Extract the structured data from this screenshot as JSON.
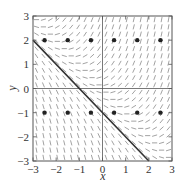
{
  "chart_data": {
    "type": "slope_field",
    "title": "",
    "equation_implied": "dy/dx = x + y",
    "xlabel": "x",
    "ylabel": "y",
    "xlim": [
      -3,
      3
    ],
    "ylim": [
      -3,
      3
    ],
    "xticks": [
      -3,
      -2,
      -1,
      0,
      1,
      2,
      3
    ],
    "yticks": [
      -3,
      -2,
      -1,
      0,
      1,
      2,
      3
    ],
    "xtick_labels": [
      "−3",
      "−2",
      "−1",
      "0",
      "1",
      "2",
      "3"
    ],
    "ytick_labels": [
      "−3",
      "−2",
      "−1",
      "0",
      "1",
      "2",
      "3"
    ],
    "grid": false,
    "axes_lines_through_origin": true,
    "field_grid": {
      "start": -2.85,
      "step": 0.3,
      "count": 20
    },
    "solution_line": {
      "label": "y = -x - 1",
      "points": [
        [
          -3,
          2
        ],
        [
          2,
          -3
        ]
      ]
    },
    "marked_points": [
      [
        -2.5,
        2
      ],
      [
        -1.5,
        2
      ],
      [
        -0.5,
        2
      ],
      [
        0.5,
        2
      ],
      [
        1.5,
        2
      ],
      [
        2.5,
        2
      ],
      [
        -2.5,
        -1
      ],
      [
        -1.5,
        -1
      ],
      [
        -0.5,
        -1
      ],
      [
        0.5,
        -1
      ],
      [
        1.5,
        -1
      ],
      [
        2.5,
        -1
      ]
    ],
    "colors": {
      "field": "#8a8a8a",
      "frame": "#555555",
      "line": "#333333",
      "points": "#222222"
    }
  },
  "layout": {
    "plot_left": 33,
    "plot_top": 16,
    "plot_width": 139,
    "plot_height": 145
  }
}
